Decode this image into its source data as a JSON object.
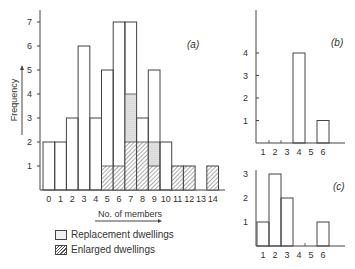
{
  "chart_data": [
    {
      "panel": "(a)",
      "type": "bar",
      "title": "(a)",
      "xlabel": "No. of members",
      "ylabel": "Frequency",
      "categories": [
        "0",
        "1",
        "2",
        "3",
        "4",
        "5",
        "6",
        "7",
        "8",
        "9",
        "10",
        "11",
        "12",
        "13",
        "14"
      ],
      "ylim": [
        0,
        7
      ],
      "yticks": [
        1,
        2,
        3,
        4,
        5,
        6,
        7
      ],
      "series": [
        {
          "name": "Total",
          "values": [
            2,
            2,
            3,
            6,
            3,
            5,
            7,
            7,
            3,
            5,
            2,
            1,
            1,
            0,
            1
          ]
        },
        {
          "name": "Replacement dwellings",
          "values": [
            0,
            0,
            0,
            0,
            0,
            0,
            0,
            2,
            0,
            1,
            0,
            0,
            0,
            0,
            0
          ]
        },
        {
          "name": "Enlarged dwellings",
          "values": [
            0,
            0,
            0,
            0,
            0,
            1,
            1,
            2,
            2,
            1,
            0,
            1,
            1,
            0,
            1
          ]
        }
      ]
    },
    {
      "panel": "(b)",
      "type": "bar",
      "title": "(b)",
      "categories": [
        "1",
        "2",
        "3",
        "4",
        "5",
        "6"
      ],
      "values": [
        0,
        0,
        0,
        4,
        0,
        1
      ],
      "ylim": [
        0,
        5
      ],
      "yticks": [
        1,
        2,
        3,
        4
      ]
    },
    {
      "panel": "(c)",
      "type": "bar",
      "title": "(c)",
      "categories": [
        "1",
        "2",
        "3",
        "4",
        "5",
        "6"
      ],
      "values": [
        1,
        3,
        2,
        0,
        0,
        1
      ],
      "ylim": [
        0,
        3
      ],
      "yticks": [
        1,
        2,
        3
      ]
    }
  ],
  "legend": {
    "replacement": "Replacement dwellings",
    "enlarged": "Enlarged dwellings"
  },
  "labels": {
    "panel_a": "(a)",
    "panel_b": "(b)",
    "panel_c": "(c)",
    "xlabel": "No. of members",
    "ylabel": "Frequency"
  }
}
